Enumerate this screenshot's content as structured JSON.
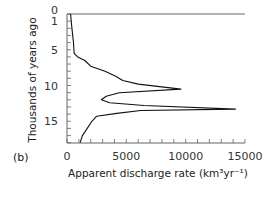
{
  "chart_data": {
    "type": "line",
    "panel_label": "(b)",
    "title": "",
    "xlabel": "Apparent discharge rate (km³yr⁻¹)",
    "ylabel": "Thousands of years ago",
    "xlim": [
      0,
      15000
    ],
    "ylim": [
      0,
      18
    ],
    "y_inverted": true,
    "grid": false,
    "x_ticks": [
      0,
      5000,
      10000,
      15000
    ],
    "x_tick_labels": [
      "0",
      "5000",
      "10000",
      "15000"
    ],
    "x_minor_tick_step": 1000,
    "y_ticks": [
      0,
      1,
      5,
      10,
      15
    ],
    "y_tick_labels": [
      "0",
      "1",
      "5",
      "10",
      "15"
    ],
    "y_minor_tick_step": 1,
    "series": [
      {
        "name": "Apparent discharge rate",
        "points": [
          {
            "age": 0.0,
            "rate": 300
          },
          {
            "age": 1.0,
            "rate": 350
          },
          {
            "age": 2.5,
            "rate": 450
          },
          {
            "age": 4.0,
            "rate": 550
          },
          {
            "age": 5.5,
            "rate": 600
          },
          {
            "age": 6.0,
            "rate": 900
          },
          {
            "age": 6.5,
            "rate": 1500
          },
          {
            "age": 7.3,
            "rate": 2000
          },
          {
            "age": 8.0,
            "rate": 3200
          },
          {
            "age": 8.7,
            "rate": 4100
          },
          {
            "age": 9.3,
            "rate": 4700
          },
          {
            "age": 9.8,
            "rate": 6000
          },
          {
            "age": 10.5,
            "rate": 9600
          },
          {
            "age": 11.0,
            "rate": 4400
          },
          {
            "age": 11.5,
            "rate": 3300
          },
          {
            "age": 12.0,
            "rate": 2900
          },
          {
            "age": 12.4,
            "rate": 3600
          },
          {
            "age": 12.8,
            "rate": 6500
          },
          {
            "age": 13.3,
            "rate": 14200
          },
          {
            "age": 13.5,
            "rate": 6200
          },
          {
            "age": 13.9,
            "rate": 4200
          },
          {
            "age": 14.3,
            "rate": 2500
          },
          {
            "age": 15.0,
            "rate": 2100
          },
          {
            "age": 16.0,
            "rate": 1700
          },
          {
            "age": 17.0,
            "rate": 1300
          },
          {
            "age": 18.0,
            "rate": 1100
          }
        ]
      }
    ]
  }
}
